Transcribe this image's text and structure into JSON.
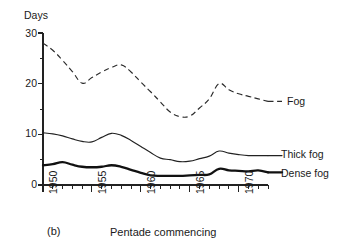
{
  "figure": {
    "panel_letter": "(b)",
    "x_axis_caption": "Pentade commencing",
    "y_axis_label": "Days"
  },
  "chart_data": {
    "type": "line",
    "title": "",
    "subtitle": "",
    "xlabel": "Pentade commencing",
    "ylabel": "Days",
    "xlim": [
      1950,
      1973
    ],
    "ylim": [
      0,
      30
    ],
    "grid": false,
    "legend_position": "right-inline",
    "y_ticks_major": [
      0,
      10,
      20,
      30
    ],
    "y_ticks_minor": [
      5,
      15,
      25
    ],
    "x_ticks_labeled": [
      1950,
      1955,
      1960,
      1965,
      1970
    ],
    "x_tick_interval": 1,
    "x": [
      1950,
      1951,
      1952,
      1953,
      1954,
      1955,
      1956,
      1957,
      1958,
      1959,
      1960,
      1961,
      1962,
      1963,
      1964,
      1965,
      1966,
      1967,
      1968,
      1969,
      1970,
      1971,
      1972,
      1973
    ],
    "series": [
      {
        "name": "Fog",
        "style": "dashed",
        "values": [
          28.0,
          26.6,
          24.6,
          22.4,
          20.1,
          21.2,
          22.3,
          23.2,
          23.7,
          22.3,
          20.3,
          18.4,
          16.4,
          14.4,
          13.5,
          13.6,
          15.2,
          17.0,
          20.0,
          18.8,
          18.0,
          17.5,
          17.0,
          16.5
        ]
      },
      {
        "name": "Thick fog",
        "style": "solid-thin",
        "values": [
          10.3,
          10.1,
          9.7,
          9.1,
          8.6,
          8.5,
          9.4,
          10.2,
          9.8,
          8.8,
          7.6,
          6.4,
          5.3,
          5.0,
          4.6,
          4.7,
          5.2,
          5.7,
          6.7,
          6.3,
          6.0,
          5.8,
          5.8,
          5.8
        ]
      },
      {
        "name": "Dense fog",
        "style": "solid-thick",
        "values": [
          3.9,
          4.1,
          4.5,
          4.0,
          3.6,
          3.5,
          3.6,
          3.9,
          3.6,
          3.0,
          2.4,
          1.9,
          1.8,
          1.8,
          1.8,
          1.9,
          2.0,
          2.1,
          3.2,
          2.9,
          2.8,
          2.7,
          2.9,
          2.5
        ]
      }
    ],
    "legend": [
      "Fog",
      "Thick fog",
      "Dense fog"
    ],
    "annotations": [
      "(b)"
    ]
  },
  "geometry": {
    "plot_left": 43,
    "plot_right": 268,
    "plot_top": 33,
    "plot_bottom": 185,
    "x_min": 1950,
    "x_max": 1973,
    "y_min": 0,
    "y_max": 30
  }
}
